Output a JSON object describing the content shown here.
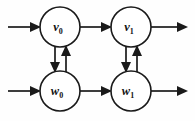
{
  "diagram": {
    "background_color": "#fefefe",
    "stroke_color": "#1a1a1a",
    "node_fill": "#ffffff",
    "nodes": [
      {
        "id": "v0",
        "base": "v",
        "sub": "0",
        "cx": 60,
        "cy": 27,
        "r": 20
      },
      {
        "id": "v1",
        "base": "v",
        "sub": "1",
        "cx": 131,
        "cy": 27,
        "r": 20
      },
      {
        "id": "w0",
        "base": "w",
        "sub": "0",
        "cx": 60,
        "cy": 91,
        "r": 20
      },
      {
        "id": "w1",
        "base": "w",
        "sub": "1",
        "cx": 131,
        "cy": 91,
        "r": 20
      }
    ],
    "edges": [
      {
        "id": "in-v0",
        "from": "external-left-top",
        "to": "v0",
        "direction": "right"
      },
      {
        "id": "in-w0",
        "from": "external-left-bottom",
        "to": "w0",
        "direction": "right"
      },
      {
        "id": "v0-to-v1",
        "from": "v0",
        "to": "v1",
        "direction": "right"
      },
      {
        "id": "w0-to-w1",
        "from": "w0",
        "to": "w1",
        "direction": "right"
      },
      {
        "id": "v1-out",
        "from": "v1",
        "to": "external-right-top",
        "direction": "right"
      },
      {
        "id": "w1-out",
        "from": "w1",
        "to": "external-right-bottom",
        "direction": "right"
      },
      {
        "id": "v0-to-w0",
        "from": "v0",
        "to": "w0",
        "direction": "down"
      },
      {
        "id": "w0-to-v0",
        "from": "w0",
        "to": "v0",
        "direction": "up"
      },
      {
        "id": "v1-to-w1",
        "from": "v1",
        "to": "w1",
        "direction": "down"
      },
      {
        "id": "w1-to-v1",
        "from": "w1",
        "to": "v1",
        "direction": "up"
      }
    ]
  }
}
